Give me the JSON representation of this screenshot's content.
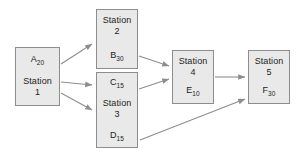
{
  "diagram": {
    "type": "process-flow-network",
    "style": {
      "node_fill": "#e9e9e9",
      "node_border": "#8d8d8d",
      "edge_color": "#8d8d8d",
      "text_color": "#1d1d1d",
      "background": "#ffffff"
    },
    "nodes": [
      {
        "id": "station1",
        "lines": [
          "A",
          "Station",
          "1"
        ],
        "task_label": "A",
        "task_time": "20",
        "station_word": "Station",
        "station_number": "1"
      },
      {
        "id": "station2",
        "lines": [
          "Station",
          "2",
          "B"
        ],
        "task_label": "B",
        "task_time": "30",
        "station_word": "Station",
        "station_number": "2"
      },
      {
        "id": "station3",
        "task_label_top": "C",
        "task_time_top": "15",
        "station_word": "Station",
        "station_number": "3",
        "task_label_bottom": "D",
        "task_time_bottom": "15"
      },
      {
        "id": "station4",
        "task_label": "E",
        "task_time": "10",
        "station_word": "Station",
        "station_number": "4"
      },
      {
        "id": "station5",
        "task_label": "F",
        "task_time": "30",
        "station_word": "Station",
        "station_number": "5"
      }
    ],
    "edges": [
      {
        "id": "e1",
        "from": "station1",
        "to": "station2",
        "label": ""
      },
      {
        "id": "e2",
        "from": "station1",
        "to": "station3-c",
        "label": ""
      },
      {
        "id": "e3",
        "from": "station1",
        "to": "station3-d",
        "label": ""
      },
      {
        "id": "e4",
        "from": "station2",
        "to": "station4",
        "label": ""
      },
      {
        "id": "e5",
        "from": "station3-c",
        "to": "station4",
        "label": ""
      },
      {
        "id": "e6",
        "from": "station4",
        "to": "station5",
        "label": ""
      },
      {
        "id": "e7",
        "from": "station3-d",
        "to": "station5",
        "label": ""
      }
    ]
  }
}
